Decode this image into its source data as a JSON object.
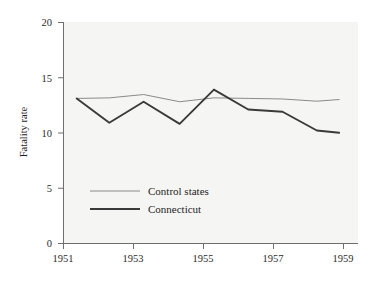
{
  "chart_data": {
    "type": "line",
    "title": "",
    "subtitle": "",
    "xlabel": "",
    "ylabel": "Fatality rate",
    "xlim": [
      1951,
      1959.6
    ],
    "ylim": [
      0,
      20
    ],
    "xticks": [
      1951,
      1953,
      1955,
      1957,
      1959
    ],
    "xtick_labels": [
      "1951",
      "1953",
      "1955",
      "1957",
      "1959"
    ],
    "yticks": [
      0,
      5,
      10,
      15,
      20
    ],
    "ytick_labels": [
      "0",
      "5",
      "10",
      "15",
      "20"
    ],
    "grid": false,
    "legend_position": "center-left",
    "x": [
      1951.4,
      1952.35,
      1953.35,
      1954.4,
      1955.4,
      1956.4,
      1957.4,
      1958.4,
      1959.05
    ],
    "series": [
      {
        "name": "Control states",
        "color": "#8a8a8a",
        "line_width": 1.0,
        "values": [
          13.1,
          13.15,
          13.45,
          12.8,
          13.15,
          13.1,
          13.05,
          12.85,
          13.0
        ]
      },
      {
        "name": "Connecticut",
        "color": "#3a3a3a",
        "line_width": 1.9,
        "values": [
          13.1,
          10.9,
          12.8,
          10.8,
          13.9,
          12.1,
          11.9,
          10.2,
          10.0
        ]
      }
    ]
  },
  "legend": {
    "entries": [
      {
        "label": "Control states",
        "swatch": "line-swatch-control"
      },
      {
        "label": "Connecticut",
        "swatch": "line-swatch-connecticut"
      }
    ]
  },
  "axes": {
    "y_axis_title": "Fatality rate",
    "y_tick_0": "0",
    "y_tick_5": "5",
    "y_tick_10": "10",
    "y_tick_15": "15",
    "y_tick_20": "20",
    "x_tick_1951": "1951",
    "x_tick_1953": "1953",
    "x_tick_1955": "1955",
    "x_tick_1957": "1957",
    "x_tick_1959": "1959"
  },
  "colors": {
    "plot_background": "#f5f5f3",
    "figure_background": "#ffffff",
    "axis": "#6f6f6f",
    "text": "#1e1e1e",
    "control_states_line": "#8a8a8a",
    "connecticut_line": "#3a3a3a"
  }
}
